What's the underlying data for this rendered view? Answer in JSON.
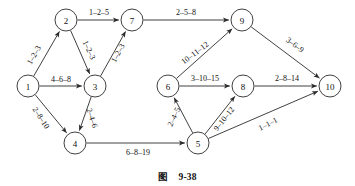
{
  "figure": {
    "caption_label": "图",
    "caption_number": "9-38",
    "colors": {
      "stroke": "#2b2b2b",
      "node_fill": "#ffffff",
      "text": "#111111",
      "background": "#ffffff"
    }
  },
  "diagram": {
    "type": "directed-network",
    "node_radius": 11,
    "nodes": [
      {
        "id": "1",
        "label": "1",
        "x": 28,
        "y": 86
      },
      {
        "id": "2",
        "label": "2",
        "x": 66,
        "y": 20
      },
      {
        "id": "3",
        "label": "3",
        "x": 95,
        "y": 86
      },
      {
        "id": "4",
        "label": "4",
        "x": 75,
        "y": 143
      },
      {
        "id": "5",
        "label": "5",
        "x": 198,
        "y": 143
      },
      {
        "id": "6",
        "label": "6",
        "x": 168,
        "y": 86
      },
      {
        "id": "7",
        "label": "7",
        "x": 132,
        "y": 20
      },
      {
        "id": "8",
        "label": "8",
        "x": 243,
        "y": 86
      },
      {
        "id": "9",
        "label": "9",
        "x": 242,
        "y": 20
      },
      {
        "id": "10",
        "label": "10",
        "x": 330,
        "y": 86
      }
    ],
    "edges": [
      {
        "from": "1",
        "to": "2",
        "label": "1–2–3",
        "lx": 34,
        "ly": 55,
        "rotate": -60
      },
      {
        "from": "1",
        "to": "3",
        "label": "4–6–8",
        "lx": 61,
        "ly": 79,
        "rotate": 0
      },
      {
        "from": "1",
        "to": "4",
        "label": "2–8–10",
        "lx": 41,
        "ly": 118,
        "rotate": 57
      },
      {
        "from": "2",
        "to": "3",
        "label": "1–2–3",
        "lx": 89,
        "ly": 50,
        "rotate": 65
      },
      {
        "from": "2",
        "to": "7",
        "label": "1–2–5",
        "lx": 99,
        "ly": 12,
        "rotate": 0
      },
      {
        "from": "3",
        "to": "4",
        "label": "2–4–6",
        "lx": 92,
        "ly": 118,
        "rotate": 72
      },
      {
        "from": "3",
        "to": "7",
        "label": "1–2–3",
        "lx": 118,
        "ly": 53,
        "rotate": -62
      },
      {
        "from": "4",
        "to": "5",
        "label": "6–8–19",
        "lx": 138,
        "ly": 152,
        "rotate": 0
      },
      {
        "from": "5",
        "to": "6",
        "label": "2–4–5",
        "lx": 174,
        "ly": 117,
        "rotate": -65
      },
      {
        "from": "5",
        "to": "8",
        "label": "9–10–12",
        "lx": 224,
        "ly": 119,
        "rotate": -52
      },
      {
        "from": "5",
        "to": "10",
        "label": "1–1–1",
        "lx": 268,
        "ly": 124,
        "rotate": -28
      },
      {
        "from": "6",
        "to": "8",
        "label": "3–10–15",
        "lx": 205,
        "ly": 78,
        "rotate": 0
      },
      {
        "from": "6",
        "to": "9",
        "label": "10–11–12",
        "lx": 195,
        "ly": 53,
        "rotate": -37
      },
      {
        "from": "7",
        "to": "9",
        "label": "2–5–8",
        "lx": 186,
        "ly": 12,
        "rotate": 0
      },
      {
        "from": "8",
        "to": "10",
        "label": "2–8–14",
        "lx": 287,
        "ly": 78,
        "rotate": 0
      },
      {
        "from": "9",
        "to": "10",
        "label": "3–6–9",
        "lx": 295,
        "ly": 45,
        "rotate": 37
      }
    ]
  }
}
